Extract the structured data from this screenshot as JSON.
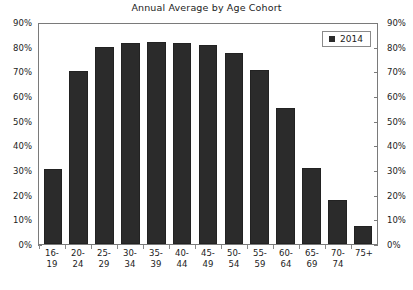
{
  "chart_data": {
    "type": "bar",
    "title": "Annual Average by Age Cohort",
    "xlabel": "",
    "ylabel": "",
    "ylim": [
      0,
      90
    ],
    "ytick_labels": [
      "90%",
      "80%",
      "70%",
      "60%",
      "50%",
      "40%",
      "30%",
      "20%",
      "10%",
      "0%"
    ],
    "ytick_values": [
      90,
      80,
      70,
      60,
      50,
      40,
      30,
      20,
      10,
      0
    ],
    "y_axis_left_labels": [
      "90%",
      "80%",
      "70%",
      "60%",
      "50%",
      "40%",
      "30%",
      "20%",
      "10%",
      "0%"
    ],
    "y_axis_right_labels": [
      "90%",
      "80%",
      "70%",
      "60%",
      "50%",
      "40%",
      "30%",
      "20%",
      "10%",
      "0%"
    ],
    "grid": false,
    "legend_position": "top-right",
    "legend": [
      "2014"
    ],
    "categories": [
      "16-19",
      "20-24",
      "25-29",
      "30-34",
      "35-39",
      "40-44",
      "45-49",
      "50-54",
      "55-59",
      "60-64",
      "65-69",
      "70-74",
      "75+"
    ],
    "category_lines": [
      [
        "16-",
        "19"
      ],
      [
        "20-",
        "24"
      ],
      [
        "25-",
        "29"
      ],
      [
        "30-",
        "34"
      ],
      [
        "35-",
        "39"
      ],
      [
        "40-",
        "44"
      ],
      [
        "45-",
        "49"
      ],
      [
        "50-",
        "54"
      ],
      [
        "55-",
        "59"
      ],
      [
        "60-",
        "64"
      ],
      [
        "65-",
        "69"
      ],
      [
        "70-",
        "74"
      ],
      [
        "75+",
        ""
      ]
    ],
    "series": [
      {
        "name": "2014",
        "color": "#2b2b2b",
        "values": [
          30.5,
          70.0,
          80.0,
          81.5,
          82.0,
          81.5,
          80.5,
          77.5,
          70.5,
          55.0,
          31.0,
          18.0,
          7.5
        ]
      }
    ]
  },
  "legend": {
    "entry_label": "2014",
    "swatch_color": "#2b2b2b"
  },
  "colors": {
    "bar": "#2b2b2b",
    "axis": "#7a7a7a",
    "text": "#1c1c1c",
    "background": "#ffffff"
  }
}
